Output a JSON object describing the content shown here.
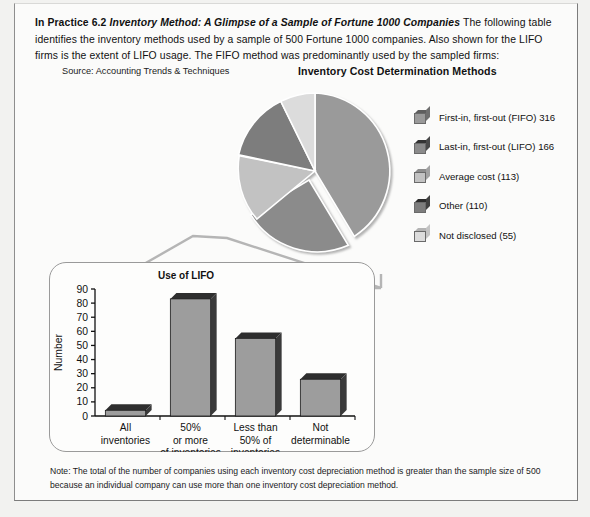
{
  "intro": {
    "bold_lead": "In Practice 6.2",
    "bold_italic_title": "Inventory Method: A Glimpse of a Sample of Fortune 1000 Companies",
    "body": "The following table identifies the inventory methods used by a sample of 500 Fortune 1000 companies. Also shown for the LIFO firms is the extent of LIFO usage. The FIFO method was predominantly used by the sampled firms:"
  },
  "source": "Source: Accounting Trends & Techniques",
  "pie": {
    "title": "Inventory Cost Determination Methods"
  },
  "legend": {
    "items": [
      {
        "label": "First-in, first-out (FIFO) 316",
        "color": "#9a9a9a",
        "top": "#5e5e5e",
        "side": "#6f6f6f"
      },
      {
        "label": "Last-in, first-out (LIFO) 166",
        "color": "#8b8b8b",
        "top": "#333333",
        "side": "#4a4a4a"
      },
      {
        "label": "Average cost (113)",
        "color": "#c2c2c2",
        "top": "#8d8d8d",
        "side": "#a2a2a2"
      },
      {
        "label": "Other (110)",
        "color": "#7d7d7d",
        "top": "#2c2c2c",
        "side": "#414141"
      },
      {
        "label": "Not disclosed (55)",
        "color": "#dcdcdc",
        "top": "#b4b4b4",
        "side": "#c4c4c4"
      }
    ]
  },
  "bar_title": "Use of LIFO",
  "note": "Note: The total of the number of companies using each inventory cost depreciation method is greater than the sample size of 500 because an individual company can use more than one inventory cost depreciation method.",
  "chart_data": [
    {
      "type": "pie",
      "title": "Inventory Cost Determination Methods",
      "labels": [
        "First-in, first-out (FIFO)",
        "Last-in, first-out (LIFO)",
        "Average cost",
        "Other",
        "Not disclosed"
      ],
      "values": [
        316,
        166,
        113,
        110,
        55
      ],
      "total": 760,
      "exploded_slice": "Last-in, first-out (LIFO)",
      "legend_position": "right",
      "colors": [
        "#9a9a9a",
        "#8b8b8b",
        "#c2c2c2",
        "#7d7d7d",
        "#dcdcdc"
      ]
    },
    {
      "type": "bar",
      "title": "Use of LIFO",
      "categories": [
        "All inventories",
        "50% or more of inventories",
        "Less than 50% of inventories",
        "Not determinable"
      ],
      "category_lines": [
        [
          "All",
          "inventories"
        ],
        [
          "50%",
          "or more",
          "of inventories"
        ],
        [
          "Less than",
          "50% of",
          "inventories"
        ],
        [
          "Not",
          "determinable"
        ]
      ],
      "values": [
        4,
        83,
        55,
        26
      ],
      "xlabel": "",
      "ylabel": "Number",
      "ylim": [
        0,
        90
      ],
      "yticks": [
        0,
        10,
        20,
        30,
        40,
        50,
        60,
        70,
        80,
        90
      ],
      "grid": false,
      "bar_color": "#9d9d9d"
    }
  ]
}
